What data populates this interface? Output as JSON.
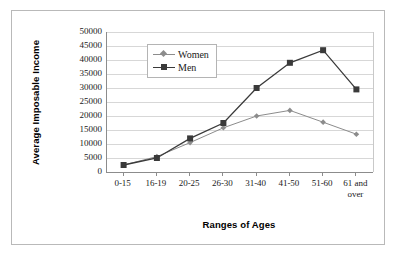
{
  "chart_data": {
    "type": "line",
    "title": "",
    "xlabel": "Ranges of Ages",
    "ylabel": "Average Imposable Income",
    "categories": [
      "0-15",
      "16-19",
      "20-25",
      "26-30",
      "31-40",
      "41-50",
      "51-60",
      "61 and over"
    ],
    "series": [
      {
        "name": "Women",
        "marker": "diamond",
        "color": "#8c8c8c",
        "values": [
          2500,
          5500,
          10500,
          15800,
          20000,
          22000,
          17800,
          13500
        ]
      },
      {
        "name": "Men",
        "marker": "square",
        "color": "#3a3a3a",
        "values": [
          2500,
          5000,
          12000,
          17500,
          30000,
          39000,
          43500,
          29500
        ]
      }
    ],
    "ylim": [
      0,
      50000
    ],
    "ytick_step": 5000,
    "yticks": [
      "0",
      "5000",
      "10000",
      "15000",
      "20000",
      "25000",
      "30000",
      "35000",
      "40000",
      "45000",
      "50000"
    ],
    "grid": true,
    "legend_position": "inside-top-left"
  },
  "colors": {
    "women": "#8c8c8c",
    "men": "#3a3a3a",
    "gridline": "#d7d7d7",
    "axis": "#8c8c8c",
    "frame": "#b9b9b9",
    "text": "#1a1a1a"
  }
}
